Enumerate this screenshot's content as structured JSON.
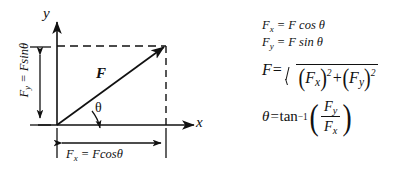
{
  "figure": {
    "type": "vector-decomposition-diagram",
    "background_color": "#ffffff",
    "line_color": "#111111"
  },
  "diagram": {
    "axis_labels": {
      "x": "x",
      "y": "y"
    },
    "vector_label": "F",
    "angle_label": "θ",
    "horizontal_component": {
      "symbol": "F",
      "subscript": "x",
      "equals": " = ",
      "expression": "Fcosθ",
      "full": "Fₓ = Fcosθ"
    },
    "vertical_component": {
      "symbol": "F",
      "subscript": "y",
      "equals": " = ",
      "expression": "Fsinθ",
      "full": "Fᵧ = Fsinθ"
    }
  },
  "equations": {
    "fx": {
      "lhs_symbol": "F",
      "lhs_subscript": "x",
      "rhs": " = F cos θ"
    },
    "fy": {
      "lhs_symbol": "F",
      "lhs_subscript": "y",
      "rhs": " = F sin θ"
    },
    "magnitude": {
      "lhs": "F",
      "equals": "=",
      "term1_symbol": "F",
      "term1_subscript": "x",
      "term1_exponent": "2",
      "operator": "+",
      "term2_symbol": "F",
      "term2_subscript": "y",
      "term2_exponent": "2",
      "open_paren": "(",
      "close_paren": ")"
    },
    "angle": {
      "lhs": "θ",
      "equals": "=",
      "function": "tan",
      "exponent": "−1",
      "open_paren": "(",
      "close_paren": ")",
      "numerator_symbol": "F",
      "numerator_subscript": "y",
      "denominator_symbol": "F",
      "denominator_subscript": "x"
    }
  }
}
